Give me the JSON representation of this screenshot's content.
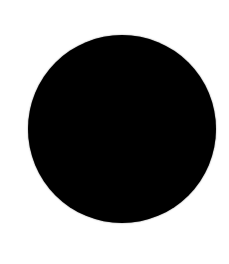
{
  "canvas": {
    "width": 229,
    "height": 264,
    "background_color": "#ffffff"
  },
  "shape": {
    "type": "circle",
    "fill_color": "#000000",
    "center_x": 122,
    "center_y": 129,
    "diameter": 188
  }
}
